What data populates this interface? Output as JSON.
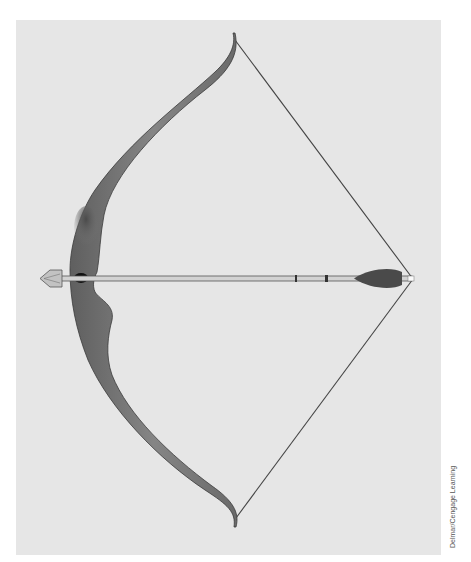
{
  "illustration": {
    "subject": "Recurve bow with nocked arrow",
    "colors": {
      "background_panel": "#e6e6e6",
      "limb": "#7a7a7a",
      "limb_dark": "#5a5a5a",
      "grip_shadow": "#555555",
      "string": "#444444",
      "arrow_shaft": "#cfcfcf",
      "fletching": "#4a4a4a",
      "arrowhead": "#bdbdbd",
      "arrow_rest": "#111111"
    }
  },
  "credit": "Delmar/Cengage Learning"
}
